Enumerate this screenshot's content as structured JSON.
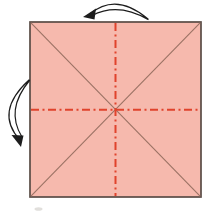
{
  "diagram": {
    "type": "origami-step",
    "paper_shape": "square",
    "creases": [
      {
        "name": "diagonal-top-left-to-bottom-right",
        "style": "solid"
      },
      {
        "name": "diagonal-top-right-to-bottom-left",
        "style": "solid"
      },
      {
        "name": "vertical-center-fold-line",
        "style": "dash-dot"
      },
      {
        "name": "horizontal-center-fold-line",
        "style": "dash-dot"
      }
    ],
    "arrows": [
      {
        "name": "top-fold-unfold-arrow",
        "position": "above-top-edge",
        "direction": "right-to-left"
      },
      {
        "name": "left-fold-unfold-arrow",
        "position": "left-of-left-edge",
        "direction": "top-to-bottom"
      }
    ]
  },
  "colors": {
    "background": "#ffffff",
    "paper": "#f6b9ad",
    "paper_border": "#5a4c46",
    "crease": "#9b7264",
    "fold_line": "#e0432c",
    "arrow": "#1d1d1d",
    "smudge": "#c8c4c0"
  }
}
